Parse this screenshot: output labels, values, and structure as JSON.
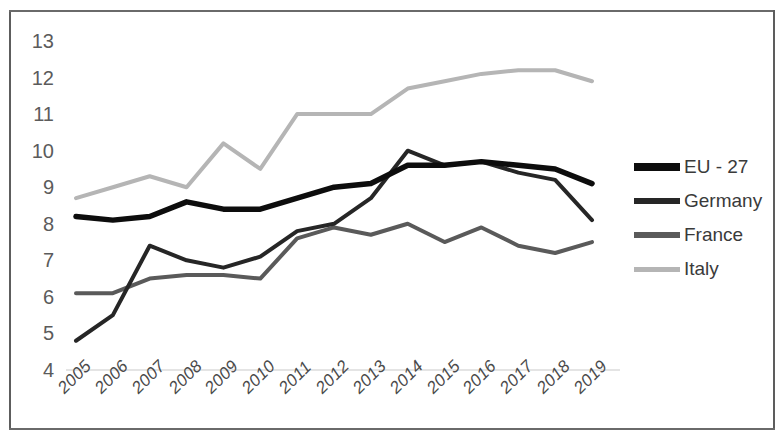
{
  "chart_data": {
    "type": "line",
    "title": "",
    "xlabel": "",
    "ylabel": "",
    "categories": [
      "2005",
      "2006",
      "2007",
      "2008",
      "2009",
      "2010",
      "2011",
      "2012",
      "2013",
      "2014",
      "2015",
      "2016",
      "2017",
      "2018",
      "2019"
    ],
    "x": [
      2005,
      2006,
      2007,
      2008,
      2009,
      2010,
      2011,
      2012,
      2013,
      2014,
      2015,
      2016,
      2017,
      2018,
      2019
    ],
    "ylim": [
      4,
      13
    ],
    "yticks": [
      4,
      5,
      6,
      7,
      8,
      9,
      10,
      11,
      12,
      13
    ],
    "grid": false,
    "legend_position": "right",
    "series": [
      {
        "name": "EU - 27",
        "color": "#0d0d0d",
        "width": 5.5,
        "values": [
          8.2,
          8.1,
          8.2,
          8.6,
          8.4,
          8.4,
          8.7,
          9.0,
          9.1,
          9.6,
          9.6,
          9.7,
          9.6,
          9.5,
          9.1
        ]
      },
      {
        "name": "Germany",
        "color": "#262626",
        "width": 4.0,
        "values": [
          4.8,
          5.5,
          7.4,
          7.0,
          6.8,
          7.1,
          7.8,
          8.0,
          8.7,
          10.0,
          9.6,
          9.7,
          9.4,
          9.2,
          8.1
        ]
      },
      {
        "name": "France",
        "color": "#5a5a5a",
        "width": 4.0,
        "values": [
          6.1,
          6.1,
          6.5,
          6.6,
          6.6,
          6.5,
          7.6,
          7.9,
          7.7,
          8.0,
          7.5,
          7.9,
          7.4,
          7.2,
          7.5
        ]
      },
      {
        "name": "Italy",
        "color": "#b5b5b5",
        "width": 4.0,
        "values": [
          8.7,
          9.0,
          9.3,
          9.0,
          10.2,
          9.5,
          11.0,
          11.0,
          11.0,
          11.7,
          11.9,
          12.1,
          12.2,
          12.2,
          11.9
        ]
      }
    ]
  },
  "legend": {
    "items": [
      {
        "label": "EU - 27",
        "color": "#0d0d0d",
        "thickness": 8
      },
      {
        "label": "Germany",
        "color": "#262626",
        "thickness": 6
      },
      {
        "label": "France",
        "color": "#5a5a5a",
        "thickness": 6
      },
      {
        "label": "Italy",
        "color": "#b5b5b5",
        "thickness": 5
      }
    ]
  },
  "axis": {
    "y_labels": [
      "13",
      "12",
      "11",
      "10",
      "9",
      "8",
      "7",
      "6",
      "5",
      "4"
    ],
    "x_labels": [
      "2005",
      "2006",
      "2007",
      "2008",
      "2009",
      "2010",
      "2011",
      "2012",
      "2013",
      "2014",
      "2015",
      "2016",
      "2017",
      "2018",
      "2019"
    ]
  }
}
